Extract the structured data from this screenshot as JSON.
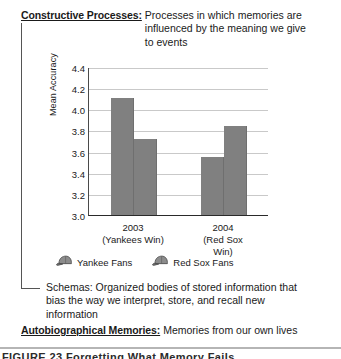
{
  "definitions": {
    "constructive": {
      "term": "Constructive Processes:",
      "text": "Processes in which memories are influenced by the meaning we give to events"
    },
    "schemas": {
      "text": "Schemas: Organized bodies of stored information that bias the way we interpret, store, and recall new information"
    },
    "autobiographical": {
      "term": "Autobiographical Memories:",
      "text": "Memories from our own lives"
    }
  },
  "caption": "FIGURE 23  Forgetting What Memory Fails",
  "chart_data": {
    "type": "bar",
    "title": "",
    "xlabel": "",
    "ylabel": "Mean Accuracy",
    "ylim": [
      3.0,
      4.4
    ],
    "ytick_values": [
      "4.4",
      "4.2",
      "4.0",
      "3.8",
      "3.6",
      "3.4",
      "3.2",
      "3.0"
    ],
    "grid": true,
    "legend_position": "bottom",
    "categories": [
      "2003",
      "2004"
    ],
    "category_sublabels": [
      "(Yankees Win)",
      "(Red Sox Win)"
    ],
    "series": [
      {
        "name": "Yankee Fans",
        "icon": "baseball-cap-icon",
        "color": "#808080",
        "values": [
          4.11,
          3.55
        ]
      },
      {
        "name": "Red Sox Fans",
        "icon": "baseball-cap-icon",
        "color": "#808080",
        "values": [
          3.72,
          3.84
        ]
      }
    ]
  },
  "colors": {
    "bar": "#808080",
    "grid": "#c9c9c9",
    "axis": "#2a2a2a"
  }
}
